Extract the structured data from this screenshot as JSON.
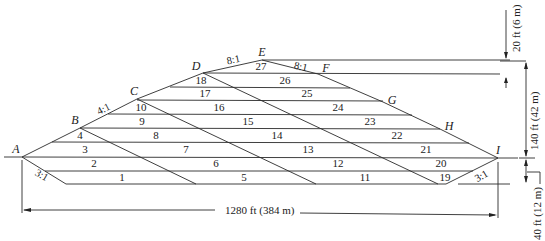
{
  "figure": {
    "points": {
      "A": "A",
      "B": "B",
      "C": "C",
      "D": "D",
      "E": "E",
      "F": "F",
      "G": "G",
      "H": "H",
      "I": "I"
    },
    "slopes": {
      "AB_BC": "4:1",
      "DE": "8:1",
      "EF": "8:1",
      "left_base": "3:1",
      "right_base": "3:1"
    },
    "cells": [
      "1",
      "2",
      "3",
      "4",
      "5",
      "6",
      "7",
      "8",
      "9",
      "10",
      "11",
      "12",
      "13",
      "14",
      "15",
      "16",
      "17",
      "18",
      "19",
      "20",
      "21",
      "22",
      "23",
      "24",
      "25",
      "26",
      "27"
    ],
    "dimensions": {
      "width": "1280 ft (384 m)",
      "top_offset": "20 ft (6 m)",
      "height": "140 ft (42 m)",
      "depth": "40 ft (12 m)"
    }
  }
}
